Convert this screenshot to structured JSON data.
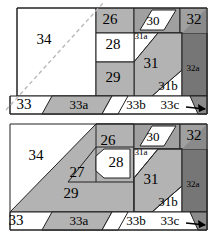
{
  "figure": {
    "type": "two-panel-polygon-partition-diagram",
    "panel_count": 2,
    "background_color": "#ffffff",
    "outline_color": "#222222",
    "dashed_guide_color": "#b9b9b9",
    "palette": {
      "white": "#ffffff",
      "light_gray": "#d4d4d4",
      "mid_gray": "#b3b3b3",
      "gray": "#a0a0a0",
      "dark_gray": "#8a8a8a",
      "darker_gray": "#767676"
    },
    "panels": [
      {
        "id": "panel-top",
        "name": "upper-figure",
        "has_dashed_diagonal": true,
        "regions": [
          {
            "ref": "34",
            "size": "lg",
            "fill": "white",
            "cx": 44,
            "cy": 41
          },
          {
            "ref": "26",
            "size": "lg",
            "fill": "mid_gray",
            "cx": 110,
            "cy": 21
          },
          {
            "ref": "30",
            "size": "md",
            "fill": "white",
            "cx": 153,
            "cy": 22
          },
          {
            "ref": "32",
            "size": "lg",
            "fill": "gray",
            "cx": 194,
            "cy": 21
          },
          {
            "ref": "28",
            "size": "lg",
            "fill": "white",
            "cx": 113,
            "cy": 46
          },
          {
            "ref": "31a",
            "size": "sm",
            "fill": "white",
            "cx": 141,
            "cy": 37
          },
          {
            "ref": "31",
            "size": "lg",
            "fill": "mid_gray",
            "cx": 151,
            "cy": 65
          },
          {
            "ref": "32a",
            "size": "sm",
            "fill": "darker_gray",
            "cx": 193,
            "cy": 69
          },
          {
            "ref": "29",
            "size": "lg",
            "fill": "mid_gray",
            "cx": 113,
            "cy": 79
          },
          {
            "ref": "31b",
            "size": "md",
            "fill": "white",
            "cx": 168,
            "cy": 87
          },
          {
            "ref": "33",
            "size": "lg",
            "fill": "white",
            "cx": 24,
            "cy": 106
          },
          {
            "ref": "33a",
            "size": "md",
            "fill": "mid_gray",
            "cx": 79,
            "cy": 106
          },
          {
            "ref": "33b",
            "size": "md",
            "fill": "white",
            "cx": 136,
            "cy": 106
          },
          {
            "ref": "33c",
            "size": "md",
            "fill": "white",
            "cx": 178,
            "cy": 106
          }
        ]
      },
      {
        "id": "panel-bottom",
        "name": "lower-figure",
        "has_dashed_diagonal": false,
        "regions": [
          {
            "ref": "34",
            "size": "lg",
            "fill": "white",
            "cx": 36,
            "cy": 41
          },
          {
            "ref": "27",
            "size": "lg",
            "fill": "mid_gray",
            "cx": 77,
            "cy": 58
          },
          {
            "ref": "26",
            "size": "lg",
            "fill": "mid_gray",
            "cx": 108,
            "cy": 26
          },
          {
            "ref": "30",
            "size": "md",
            "fill": "white",
            "cx": 153,
            "cy": 22
          },
          {
            "ref": "32",
            "size": "lg",
            "fill": "gray",
            "cx": 194,
            "cy": 21
          },
          {
            "ref": "28",
            "size": "lg",
            "fill": "white",
            "cx": 116,
            "cy": 48
          },
          {
            "ref": "31a",
            "size": "sm",
            "fill": "white",
            "cx": 141,
            "cy": 37
          },
          {
            "ref": "31",
            "size": "lg",
            "fill": "mid_gray",
            "cx": 151,
            "cy": 65
          },
          {
            "ref": "32a",
            "size": "sm",
            "fill": "darker_gray",
            "cx": 193,
            "cy": 69
          },
          {
            "ref": "29",
            "size": "lg",
            "fill": "mid_gray",
            "cx": 71,
            "cy": 79
          },
          {
            "ref": "31b",
            "size": "md",
            "fill": "white",
            "cx": 168,
            "cy": 87
          },
          {
            "ref": "33",
            "size": "lg",
            "fill": "white",
            "cx": 16,
            "cy": 106
          },
          {
            "ref": "33a",
            "size": "md",
            "fill": "mid_gray",
            "cx": 79,
            "cy": 106
          },
          {
            "ref": "33b",
            "size": "md",
            "fill": "white",
            "cx": 136,
            "cy": 106
          },
          {
            "ref": "33c",
            "size": "md",
            "fill": "white",
            "cx": 178,
            "cy": 106
          }
        ]
      }
    ]
  }
}
